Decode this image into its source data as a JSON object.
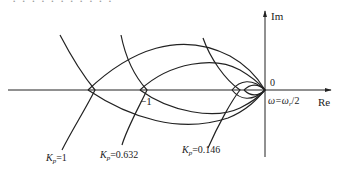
{
  "caption_cut": "· · · · · · · · · · ·",
  "axes": {
    "im_label": "Im",
    "re_label": "Re",
    "origin_label": "0",
    "minus_one_label": "−1"
  },
  "annotations": {
    "omega": "ω=ω",
    "omega_sub": "r",
    "omega_tail": "/2"
  },
  "curves": [
    {
      "name": "Kp=1",
      "K": "K",
      "sub": "p",
      "value": "=1"
    },
    {
      "name": "Kp=0.632",
      "K": "K",
      "sub": "p",
      "value": "=0.632"
    },
    {
      "name": "Kp=0.146",
      "K": "K",
      "sub": "p",
      "value": "=0.146"
    }
  ],
  "colors": {
    "stroke": "#222222",
    "background": "#ffffff"
  }
}
